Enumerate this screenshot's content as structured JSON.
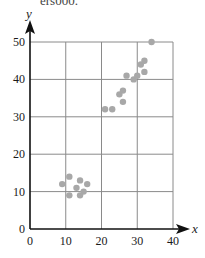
{
  "caption": "ers000.",
  "colors": {
    "grid": "#8a8a8a",
    "axis": "#111111",
    "point": "#a8a8a8"
  },
  "chart_data": {
    "type": "scatter",
    "title": "",
    "xlabel": "x",
    "ylabel": "y",
    "xlim": [
      0,
      40
    ],
    "ylim": [
      0,
      50
    ],
    "x_ticks": [
      0,
      10,
      20,
      30,
      40
    ],
    "y_ticks": [
      0,
      10,
      20,
      30,
      40,
      50
    ],
    "x_tick_labels": [
      "0",
      "10",
      "20",
      "30",
      "40"
    ],
    "y_tick_labels": [
      "0",
      "10",
      "20",
      "30",
      "40",
      "50"
    ],
    "grid": true,
    "legend": null,
    "series": [
      {
        "name": "data",
        "points": [
          {
            "x": 9,
            "y": 12
          },
          {
            "x": 11,
            "y": 14
          },
          {
            "x": 11,
            "y": 9
          },
          {
            "x": 13,
            "y": 11
          },
          {
            "x": 14,
            "y": 13
          },
          {
            "x": 14,
            "y": 9
          },
          {
            "x": 15,
            "y": 10
          },
          {
            "x": 16,
            "y": 12
          },
          {
            "x": 21,
            "y": 32
          },
          {
            "x": 23,
            "y": 32
          },
          {
            "x": 25,
            "y": 36
          },
          {
            "x": 26,
            "y": 37
          },
          {
            "x": 26,
            "y": 34
          },
          {
            "x": 27,
            "y": 41
          },
          {
            "x": 29,
            "y": 40
          },
          {
            "x": 30,
            "y": 41
          },
          {
            "x": 31,
            "y": 44
          },
          {
            "x": 32,
            "y": 45
          },
          {
            "x": 32,
            "y": 42
          },
          {
            "x": 34,
            "y": 50
          }
        ]
      }
    ]
  }
}
